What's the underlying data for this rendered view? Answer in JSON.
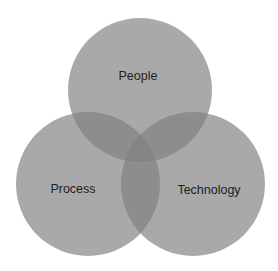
{
  "diagram": {
    "type": "venn",
    "sets": [
      {
        "id": "people",
        "label": "People"
      },
      {
        "id": "process",
        "label": "Process"
      },
      {
        "id": "technology",
        "label": "Technology"
      }
    ],
    "colors": {
      "circle_fill": "#808080",
      "label_text": "#1e1e1e",
      "background": "#ffffff"
    }
  }
}
